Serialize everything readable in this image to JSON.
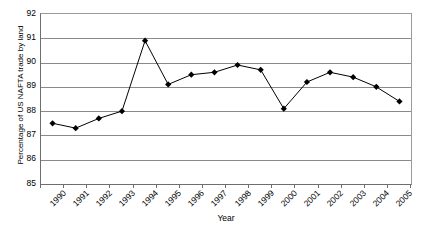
{
  "chart_data": {
    "type": "line",
    "title": "",
    "subtitle": "",
    "xlabel": "Year",
    "ylabel": "Percentage of US NAFTA trade by land",
    "categories": [
      "1990",
      "1991",
      "1992",
      "1993",
      "1994",
      "1995",
      "1996",
      "1997",
      "1998",
      "1999",
      "2000",
      "2001",
      "2002",
      "2003",
      "2004",
      "2005"
    ],
    "values": [
      87.5,
      87.3,
      87.7,
      88.0,
      90.9,
      89.1,
      89.5,
      89.6,
      89.9,
      89.7,
      88.1,
      89.2,
      89.6,
      89.4,
      89.0,
      88.4
    ],
    "series": [
      {
        "name": "Percentage of US NAFTA trade by land",
        "values": [
          87.5,
          87.3,
          87.7,
          88.0,
          90.9,
          89.1,
          89.5,
          89.6,
          89.9,
          89.7,
          88.1,
          89.2,
          89.6,
          89.4,
          89.0,
          88.4
        ]
      }
    ],
    "ylim": [
      85,
      92
    ],
    "yticks": [
      85,
      86,
      87,
      88,
      89,
      90,
      91,
      92
    ],
    "ytick_labels": [
      "85",
      "86",
      "87",
      "88",
      "89",
      "90",
      "91",
      "92"
    ],
    "grid": true,
    "grid_axis": "y",
    "legend": false,
    "legend_position": "none",
    "marker": "diamond",
    "marker_color": "#000000",
    "line_color": "#000000",
    "plot_background": "#ffffff",
    "gridline_color": "#8a8a8a",
    "axis_color": "#6e6e6e",
    "xtick_label_rotation": -45
  }
}
